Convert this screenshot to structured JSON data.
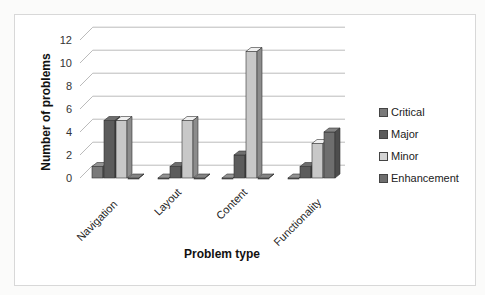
{
  "chart_data": {
    "type": "bar",
    "subtype": "3d-clustered-column",
    "title": "",
    "xlabel": "Problem type",
    "ylabel": "Number of problems",
    "categories": [
      "Navigation",
      "Layout",
      "Content",
      "Functionality"
    ],
    "series": [
      {
        "name": "Critical",
        "values": [
          1,
          0,
          0,
          0
        ],
        "color": "#7a7a7a"
      },
      {
        "name": "Major",
        "values": [
          5,
          1,
          2,
          1
        ],
        "color": "#5c5c5c"
      },
      {
        "name": "Minor",
        "values": [
          5,
          5,
          11,
          3
        ],
        "color": "#c8c8c8"
      },
      {
        "name": "Enhancement",
        "values": [
          0,
          0,
          0,
          4
        ],
        "color": "#6e6e6e"
      }
    ],
    "ylim": [
      0,
      12
    ],
    "yticks": [
      0,
      2,
      4,
      6,
      8,
      10,
      12
    ],
    "grid": true,
    "legend_position": "right"
  },
  "legend": {
    "items": [
      {
        "label": "Critical",
        "color": "#7a7a7a"
      },
      {
        "label": "Major",
        "color": "#5c5c5c"
      },
      {
        "label": "Minor",
        "color": "#d4d4d4"
      },
      {
        "label": "Enhancement",
        "color": "#6e6e6e"
      }
    ]
  },
  "axes": {
    "x_title": "Problem type",
    "y_title": "Number of problems"
  }
}
